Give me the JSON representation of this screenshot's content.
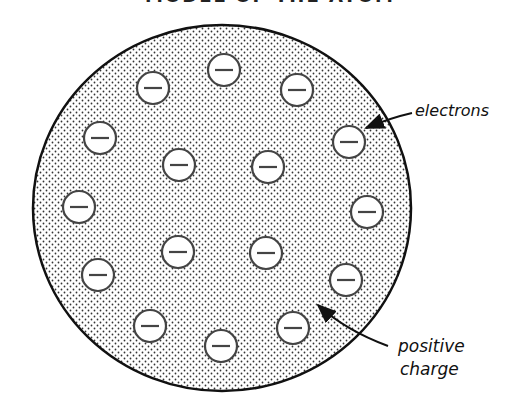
{
  "title": "MODEL OF THE ATOM",
  "atom": {
    "cx": 222,
    "cy": 208,
    "rx": 189,
    "ry": 183,
    "fill_pattern": "stippled-dots",
    "outline_color": "#111111",
    "dot_color": "#333333"
  },
  "electrons": [
    {
      "x": 224,
      "y": 70
    },
    {
      "x": 297,
      "y": 90
    },
    {
      "x": 153,
      "y": 88
    },
    {
      "x": 100,
      "y": 138
    },
    {
      "x": 349,
      "y": 142
    },
    {
      "x": 179,
      "y": 165
    },
    {
      "x": 268,
      "y": 167
    },
    {
      "x": 79,
      "y": 207
    },
    {
      "x": 367,
      "y": 212
    },
    {
      "x": 178,
      "y": 252
    },
    {
      "x": 266,
      "y": 253
    },
    {
      "x": 98,
      "y": 275
    },
    {
      "x": 346,
      "y": 280
    },
    {
      "x": 150,
      "y": 326
    },
    {
      "x": 293,
      "y": 328
    },
    {
      "x": 221,
      "y": 346
    }
  ],
  "electron_style": {
    "r": 16,
    "symbol": "−",
    "fill": "#ffffff",
    "stroke": "#444444"
  },
  "labels": {
    "electrons": "electrons",
    "positive_line1": "positive",
    "positive_line2": "charge"
  }
}
